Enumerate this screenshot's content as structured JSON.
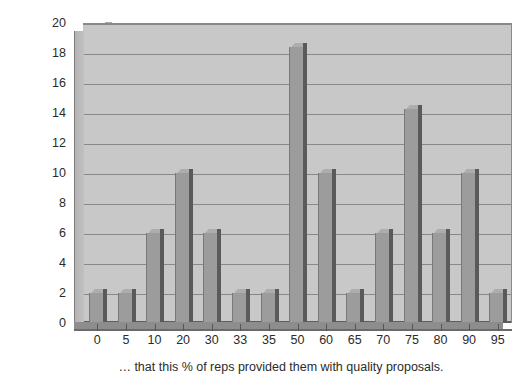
{
  "chart_data": {
    "type": "bar",
    "title": "",
    "xlabel": "… that this % of reps provided them with quality proposals.",
    "ylabel": "This % of buyers said…",
    "categories": [
      "0",
      "5",
      "10",
      "20",
      "30",
      "33",
      "35",
      "50",
      "60",
      "65",
      "70",
      "75",
      "80",
      "90",
      "95"
    ],
    "values": [
      2,
      2,
      6,
      10,
      6,
      2,
      2,
      18.4,
      10,
      2,
      6,
      14.3,
      6,
      10,
      2
    ],
    "series": [
      {
        "name": "Buyers",
        "values": [
          2,
          2,
          6,
          10,
          6,
          2,
          2,
          18.4,
          10,
          2,
          6,
          14.3,
          6,
          10,
          2
        ]
      }
    ],
    "ylim": [
      0,
      20
    ],
    "y_ticks": [
      "0",
      "2",
      "4",
      "6",
      "8",
      "10",
      "12",
      "14",
      "16",
      "18",
      "20"
    ],
    "y_tick_values": [
      0,
      2,
      4,
      6,
      8,
      10,
      12,
      14,
      16,
      18,
      20
    ],
    "grid": true,
    "legend": "none",
    "bar_color": "#9c9c9c",
    "bar_shade_color": "#5a5a5a",
    "plot_background": "#c8c8c8",
    "gridline_color": "#888888",
    "page_background": "#ffffff",
    "text_color": "#2b2b2b"
  }
}
